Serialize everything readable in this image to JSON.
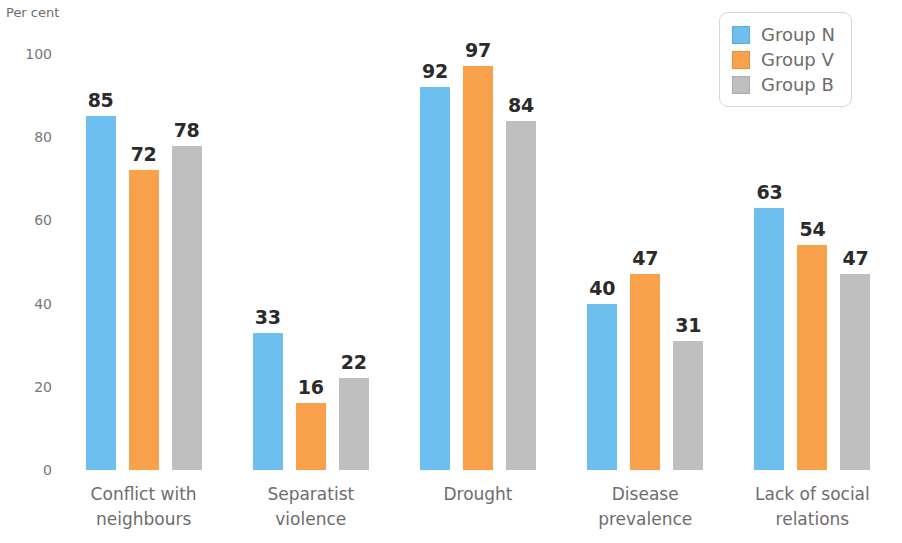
{
  "chart_data": {
    "type": "bar",
    "title": "",
    "subtitle": "",
    "xlabel": "",
    "ylabel": "Per cent",
    "ylim": [
      0,
      100
    ],
    "yticks": [
      0,
      20,
      40,
      60,
      80,
      100
    ],
    "grid": false,
    "legend_position": "top-right",
    "categories": [
      "Conflict with\nneighbours",
      "Separatist\nviolence",
      "Drought",
      "Disease\nprevalence",
      "Lack of social\nrelations"
    ],
    "series": [
      {
        "name": "Group N",
        "color": "#6CBFEF",
        "values": [
          85,
          33,
          92,
          40,
          63
        ]
      },
      {
        "name": "Group V",
        "color": "#F9A14A",
        "values": [
          72,
          16,
          97,
          47,
          54
        ]
      },
      {
        "name": "Group B",
        "color": "#BFBFBF",
        "values": [
          78,
          22,
          84,
          31,
          47
        ]
      }
    ]
  },
  "axis": {
    "y_title": "Per cent",
    "tick_labels": [
      "100",
      "80",
      "60",
      "40",
      "20",
      "0"
    ]
  },
  "legend": {
    "entries": [
      {
        "label": "Group N",
        "color": "#6CBFEF"
      },
      {
        "label": "Group V",
        "color": "#F9A14A"
      },
      {
        "label": "Group B",
        "color": "#BFBFBF"
      }
    ]
  }
}
